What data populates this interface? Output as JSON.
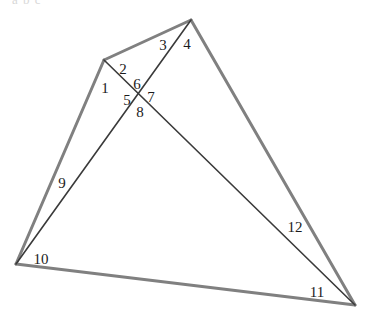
{
  "figure": {
    "cropped_header_text": "a b c",
    "background_color": "#ffffff",
    "outline_color": "#808080",
    "cevian_color": "#3a3a3a",
    "label_color": "#1b1b1b",
    "outline_width": 3,
    "cevian_width": 1.6,
    "width": 367,
    "height": 314
  },
  "points": {
    "apex": {
      "name": "apex-vertex",
      "x": 191,
      "y": 20
    },
    "left_peak": {
      "name": "left-peak-vertex",
      "x": 104,
      "y": 60
    },
    "bottom_left": {
      "name": "bottom-left-vertex",
      "x": 16,
      "y": 264
    },
    "bottom_right": {
      "name": "bottom-right-vertex",
      "x": 355,
      "y": 305
    },
    "intersection": {
      "name": "cevian-intersection",
      "x": 142,
      "y": 97
    }
  },
  "edges": [
    {
      "name": "edge-bottom-left-to-left-peak",
      "from": "bottom_left",
      "to": "left_peak",
      "style": "outline"
    },
    {
      "name": "edge-left-peak-to-apex",
      "from": "left_peak",
      "to": "apex",
      "style": "outline"
    },
    {
      "name": "edge-apex-to-bottom-right",
      "from": "apex",
      "to": "bottom_right",
      "style": "outline"
    },
    {
      "name": "edge-bottom-left-to-bottom-right",
      "from": "bottom_left",
      "to": "bottom_right",
      "style": "outline"
    },
    {
      "name": "cevian-left-peak-to-bottom-right",
      "from": "left_peak",
      "to": "bottom_right",
      "style": "cevian"
    },
    {
      "name": "cevian-bottom-left-to-apex",
      "from": "bottom_left",
      "to": "apex",
      "style": "cevian"
    }
  ],
  "angle_labels": [
    {
      "name": "angle-label-1",
      "text": "1",
      "x": 105,
      "y": 88
    },
    {
      "name": "angle-label-2",
      "text": "2",
      "x": 123,
      "y": 69
    },
    {
      "name": "angle-label-3",
      "text": "3",
      "x": 163,
      "y": 45
    },
    {
      "name": "angle-label-4",
      "text": "4",
      "x": 187,
      "y": 44
    },
    {
      "name": "angle-label-5",
      "text": "5",
      "x": 127,
      "y": 100
    },
    {
      "name": "angle-label-6",
      "text": "6",
      "x": 137,
      "y": 84
    },
    {
      "name": "angle-label-7",
      "text": "7",
      "x": 151,
      "y": 97
    },
    {
      "name": "angle-label-8",
      "text": "8",
      "x": 140,
      "y": 112
    },
    {
      "name": "angle-label-9",
      "text": "9",
      "x": 62,
      "y": 183
    },
    {
      "name": "angle-label-10",
      "text": "10",
      "x": 41,
      "y": 259
    },
    {
      "name": "angle-label-11",
      "text": "11",
      "x": 317,
      "y": 292
    },
    {
      "name": "angle-label-12",
      "text": "12",
      "x": 295,
      "y": 227
    }
  ]
}
